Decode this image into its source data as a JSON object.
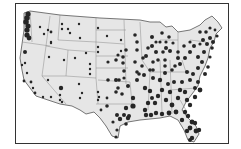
{
  "map": {
    "type": "dot-density map",
    "region": "Contiguous United States",
    "colors": {
      "land": "#e6e6e6",
      "state_border": "#8a8a8a",
      "outline": "#555555",
      "dot": "#262626",
      "frame": "#333333"
    },
    "dots": [
      [
        28,
        14,
        2.6
      ],
      [
        27,
        18,
        2.8
      ],
      [
        26,
        22,
        2.8
      ],
      [
        28,
        26,
        2.6
      ],
      [
        27,
        30,
        2.6
      ],
      [
        27,
        35,
        2.6
      ],
      [
        29,
        38,
        2.4
      ],
      [
        40,
        27,
        1.2
      ],
      [
        48,
        30,
        1.2
      ],
      [
        51,
        32,
        1.4
      ],
      [
        44,
        34,
        1.2
      ],
      [
        51,
        43,
        1.2
      ],
      [
        62,
        24,
        1.2
      ],
      [
        68,
        29,
        1.2
      ],
      [
        70,
        33,
        1.2
      ],
      [
        79,
        24,
        1.2
      ],
      [
        62,
        29,
        1.2
      ],
      [
        80,
        38,
        1.2
      ],
      [
        25,
        52,
        2.0
      ],
      [
        22,
        65,
        1.2
      ],
      [
        25,
        63,
        1.2
      ],
      [
        27,
        73,
        1.2
      ],
      [
        24,
        81,
        1.4
      ],
      [
        31,
        82,
        1.4
      ],
      [
        33,
        88,
        1.2
      ],
      [
        35,
        93,
        1.4
      ],
      [
        43,
        97,
        1.2
      ],
      [
        51,
        97,
        1.2
      ],
      [
        49,
        57,
        1.2
      ],
      [
        51,
        42,
        1.2
      ],
      [
        48,
        80,
        1.2
      ],
      [
        64,
        60,
        1.2
      ],
      [
        75,
        58,
        1.2
      ],
      [
        86,
        53,
        1.2
      ],
      [
        90,
        64,
        1.2
      ],
      [
        90,
        69,
        1.2
      ],
      [
        90,
        74,
        1.2
      ],
      [
        98,
        28,
        1.2
      ],
      [
        107,
        36,
        1.2
      ],
      [
        98,
        47,
        1.2
      ],
      [
        98,
        52,
        1.2
      ],
      [
        121,
        40,
        1.2
      ],
      [
        121,
        51,
        1.2
      ],
      [
        61,
        88,
        2.2
      ],
      [
        60,
        95,
        1.2
      ],
      [
        60,
        100,
        1.2
      ],
      [
        79,
        84,
        1.2
      ],
      [
        82,
        93,
        1.2
      ],
      [
        80,
        98,
        1.2
      ],
      [
        62,
        102,
        1.2
      ],
      [
        98,
        92,
        1.2
      ],
      [
        99,
        97,
        1.2
      ],
      [
        98,
        100,
        1.2
      ],
      [
        101,
        110,
        1.4
      ],
      [
        107,
        98,
        1.4
      ],
      [
        107,
        106,
        1.8
      ],
      [
        108,
        62,
        1.6
      ],
      [
        116,
        60,
        1.8
      ],
      [
        123,
        63,
        1.8
      ],
      [
        108,
        80,
        1.8
      ],
      [
        116,
        80,
        2.0
      ],
      [
        119,
        80,
        1.8
      ],
      [
        124,
        71,
        1.8
      ],
      [
        128,
        86,
        2.0
      ],
      [
        124,
        78,
        1.6
      ],
      [
        118,
        88,
        1.8
      ],
      [
        116,
        92,
        1.8
      ],
      [
        122,
        94,
        1.8
      ],
      [
        126,
        50,
        1.8
      ],
      [
        123,
        57,
        1.8
      ],
      [
        118,
        55,
        1.6
      ],
      [
        135,
        35,
        1.8
      ],
      [
        137,
        42,
        1.8
      ],
      [
        137,
        50,
        1.8
      ],
      [
        135,
        62,
        1.8
      ],
      [
        137,
        72,
        1.8
      ],
      [
        137,
        80,
        2.0
      ],
      [
        139,
        74,
        1.8
      ],
      [
        144,
        75,
        2.0
      ],
      [
        143,
        58,
        1.8
      ],
      [
        133,
        98,
        2.2
      ],
      [
        133,
        106,
        2.6
      ],
      [
        126,
        108,
        2.2
      ],
      [
        124,
        115,
        2.0
      ],
      [
        120,
        119,
        2.2
      ],
      [
        128,
        118,
        2.2
      ],
      [
        126,
        124,
        1.8
      ],
      [
        129,
        116,
        2.0
      ],
      [
        117,
        115,
        2.0
      ],
      [
        113,
        122,
        1.6
      ],
      [
        117,
        130,
        1.6
      ],
      [
        116,
        137,
        1.6
      ],
      [
        146,
        56,
        2.0
      ],
      [
        148,
        48,
        1.8
      ],
      [
        152,
        37,
        2.0
      ],
      [
        152,
        46,
        2.0
      ],
      [
        156,
        52,
        2.0
      ],
      [
        158,
        60,
        1.8
      ],
      [
        163,
        52,
        1.8
      ],
      [
        162,
        33,
        1.8
      ],
      [
        166,
        48,
        2.0
      ],
      [
        170,
        51,
        2.0
      ],
      [
        165,
        60,
        1.8
      ],
      [
        153,
        62,
        1.8
      ],
      [
        153,
        70,
        1.8
      ],
      [
        145,
        88,
        2.2
      ],
      [
        150,
        91,
        2.2
      ],
      [
        152,
        98,
        2.0
      ],
      [
        148,
        103,
        2.2
      ],
      [
        145,
        110,
        2.2
      ],
      [
        155,
        103,
        2.2
      ],
      [
        158,
        96,
        2.2
      ],
      [
        160,
        80,
        2.2
      ],
      [
        153,
        78,
        2.0
      ],
      [
        165,
        73,
        2.0
      ],
      [
        168,
        84,
        2.0
      ],
      [
        162,
        90,
        2.2
      ],
      [
        166,
        100,
        2.2
      ],
      [
        146,
        115,
        2.2
      ],
      [
        151,
        115,
        2.2
      ],
      [
        156,
        113,
        2.2
      ],
      [
        162,
        114,
        2.2
      ],
      [
        169,
        113,
        2.4
      ],
      [
        176,
        112,
        2.4
      ],
      [
        172,
        105,
        2.4
      ],
      [
        178,
        98,
        2.2
      ],
      [
        180,
        90,
        2.2
      ],
      [
        182,
        82,
        2.0
      ],
      [
        174,
        82,
        2.0
      ],
      [
        170,
        92,
        2.2
      ],
      [
        185,
        92,
        2.2
      ],
      [
        187,
        100,
        2.2
      ],
      [
        195,
        97,
        2.2
      ],
      [
        190,
        105,
        2.2
      ],
      [
        195,
        88,
        2.0
      ],
      [
        198,
        82,
        2.0
      ],
      [
        200,
        90,
        2.4
      ],
      [
        190,
        80,
        2.0
      ],
      [
        187,
        72,
        2.0
      ],
      [
        193,
        74,
        2.0
      ],
      [
        198,
        68,
        2.0
      ],
      [
        205,
        74,
        2.0
      ],
      [
        180,
        64,
        2.0
      ],
      [
        185,
        58,
        2.0
      ],
      [
        178,
        58,
        2.0
      ],
      [
        175,
        66,
        1.8
      ],
      [
        172,
        70,
        1.8
      ],
      [
        165,
        66,
        1.8
      ],
      [
        190,
        52,
        2.0
      ],
      [
        194,
        46,
        2.0
      ],
      [
        198,
        57,
        2.0
      ],
      [
        202,
        62,
        2.0
      ],
      [
        204,
        52,
        2.0
      ],
      [
        207,
        44,
        2.0
      ],
      [
        210,
        38,
        2.0
      ],
      [
        213,
        42,
        2.0
      ],
      [
        212,
        48,
        1.8
      ],
      [
        203,
        40,
        2.0
      ],
      [
        200,
        32,
        1.8
      ],
      [
        206,
        32,
        1.8
      ],
      [
        210,
        28,
        1.6
      ],
      [
        217,
        36,
        1.6
      ],
      [
        215,
        30,
        1.4
      ],
      [
        200,
        44,
        1.6
      ],
      [
        190,
        42,
        1.6
      ],
      [
        184,
        46,
        1.8
      ],
      [
        178,
        52,
        1.8
      ],
      [
        185,
        112,
        2.2
      ],
      [
        182,
        120,
        2.2
      ],
      [
        188,
        116,
        2.2
      ],
      [
        192,
        122,
        2.4
      ],
      [
        190,
        128,
        2.4
      ],
      [
        196,
        131,
        2.4
      ],
      [
        187,
        131,
        2.2
      ],
      [
        195,
        123,
        2.2
      ],
      [
        199,
        130,
        2.2
      ],
      [
        192,
        138,
        2.2
      ],
      [
        190,
        140,
        2.0
      ],
      [
        169,
        37,
        1.8
      ],
      [
        166,
        42,
        1.6
      ],
      [
        173,
        43,
        1.6
      ],
      [
        160,
        42,
        1.6
      ],
      [
        156,
        42,
        1.6
      ],
      [
        142,
        66,
        1.8
      ],
      [
        150,
        70,
        1.8
      ],
      [
        208,
        67,
        1.8
      ],
      [
        210,
        57,
        1.6
      ]
    ]
  }
}
